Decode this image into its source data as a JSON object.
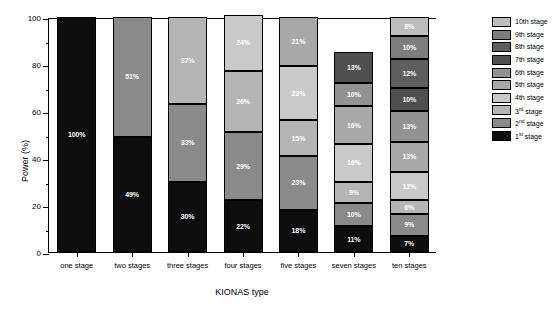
{
  "chart_data": {
    "type": "bar",
    "subtype": "stacked-percentage-bar",
    "title": "",
    "xlabel": "KIONAS type",
    "ylabel": "Power (%)",
    "ylim": [
      0,
      100
    ],
    "ytick_values": [
      0,
      20,
      40,
      60,
      80,
      100
    ],
    "ytick_labels": [
      "0",
      "20",
      "40",
      "60",
      "80",
      "100"
    ],
    "yminor_values": [
      10,
      30,
      50,
      70,
      90
    ],
    "grid": false,
    "legend_position": "right",
    "categories": [
      "one stage",
      "two stages",
      "three stages",
      "four stages",
      "five stages",
      "seven stages",
      "ten stages"
    ],
    "series": [
      {
        "name": "1st stage",
        "legend_label_html": "1<sup>st</sup> stage",
        "color": "#0d0d0d",
        "values": [
          100,
          49,
          30,
          22,
          18,
          11,
          7
        ]
      },
      {
        "name": "2nd stage",
        "legend_label_html": "2<sup>nd</sup> stage",
        "color": "#8a8a8a",
        "values": [
          null,
          51,
          33,
          29,
          23,
          10,
          9
        ]
      },
      {
        "name": "3rd stage",
        "legend_label_html": "3<sup>rd</sup> stage",
        "color": "#b5b5b5",
        "values": [
          null,
          null,
          37,
          26,
          15,
          9,
          6
        ]
      },
      {
        "name": "4th stage",
        "legend_label_html": "4th stage",
        "color": "#c9c9c9",
        "values": [
          null,
          null,
          null,
          24,
          23,
          16,
          12
        ]
      },
      {
        "name": "5th stage",
        "legend_label_html": "5th stage",
        "color": "#a8a8a8",
        "values": [
          null,
          null,
          null,
          null,
          21,
          16,
          13
        ]
      },
      {
        "name": "6th stage",
        "legend_label_html": "6th stage",
        "color": "#929292",
        "values": [
          null,
          null,
          null,
          null,
          null,
          10,
          13
        ]
      },
      {
        "name": "7th stage",
        "legend_label_html": "7th stage",
        "color": "#4f4f4f",
        "values": [
          null,
          null,
          null,
          null,
          null,
          13,
          10
        ]
      },
      {
        "name": "8th stage",
        "legend_label_html": "8th stage",
        "color": "#5e5e5e",
        "values": [
          null,
          null,
          null,
          null,
          null,
          null,
          12
        ]
      },
      {
        "name": "9th stage",
        "legend_label_html": "9th stage",
        "color": "#7d7d7d",
        "values": [
          null,
          null,
          null,
          null,
          null,
          null,
          10
        ]
      },
      {
        "name": "10th stage",
        "legend_label_html": "10th stage",
        "color": "#bdbdbd",
        "values": [
          null,
          null,
          null,
          null,
          null,
          null,
          8
        ]
      }
    ],
    "bar_labels": [
      [
        "100%"
      ],
      [
        "49%",
        "51%"
      ],
      [
        "30%",
        "33%",
        "37%"
      ],
      [
        "22%",
        "29%",
        "26%",
        "24%"
      ],
      [
        "18%",
        "23%",
        "15%",
        "23%",
        "21%"
      ],
      [
        "11%",
        "10%",
        "9%",
        "16%",
        "16%",
        "10%",
        "13%"
      ],
      [
        "7%",
        "9%",
        "6%",
        "12%",
        "13%",
        "13%",
        "10%",
        "12%",
        "10%",
        "8%"
      ]
    ]
  },
  "legend": {
    "entries": [
      {
        "label": "10th stage",
        "color": "#bdbdbd"
      },
      {
        "label": "9th stage",
        "color": "#7d7d7d"
      },
      {
        "label": "8th stage",
        "color": "#5e5e5e"
      },
      {
        "label": "7th stage",
        "color": "#4f4f4f"
      },
      {
        "label": "6th stage",
        "color": "#929292"
      },
      {
        "label": "5th stage",
        "color": "#a8a8a8"
      },
      {
        "label": "4th stage",
        "color": "#c9c9c9"
      },
      {
        "label": "3rd stage",
        "color": "#b5b5b5",
        "ordinal_base": "3",
        "ordinal_sup": "rd",
        "ordinal_tail": " stage"
      },
      {
        "label": "2nd stage",
        "color": "#8a8a8a",
        "ordinal_base": "2",
        "ordinal_sup": "nd",
        "ordinal_tail": " stage"
      },
      {
        "label": "1st stage",
        "color": "#0d0d0d",
        "ordinal_base": "1",
        "ordinal_sup": "st",
        "ordinal_tail": " stage"
      }
    ]
  }
}
